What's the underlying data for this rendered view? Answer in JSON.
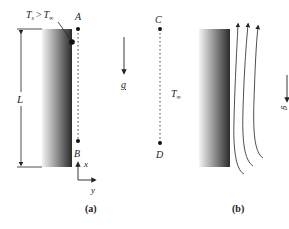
{
  "panel_a": {
    "temp_label_main": "T",
    "temp_label_sub": "s",
    "temp_label_op": ">",
    "temp_label_main2": "T",
    "temp_label_sub2": "∞",
    "point_top": "A",
    "point_bottom": "B",
    "length_label": "L",
    "gravity_label": "g",
    "axis_x": "x",
    "axis_y": "y",
    "caption": "(a)"
  },
  "panel_b": {
    "point_top": "C",
    "point_bottom": "D",
    "ambient_main": "T",
    "ambient_sub": "∞",
    "gravity_label": "g",
    "caption": "(b)"
  },
  "colors": {
    "plate_light": "#f2f2f2",
    "plate_dark": "#2a2a2a",
    "ink": "#222222"
  }
}
